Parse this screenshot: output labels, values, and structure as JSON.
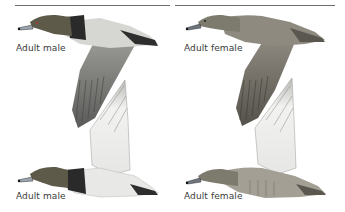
{
  "plates": [
    {
      "label": "Adult male",
      "pose": "flying-wing-down"
    },
    {
      "label": "Adult female",
      "pose": "flying-wing-down"
    },
    {
      "label": "Adult male",
      "pose": "flying-wing-up"
    },
    {
      "label": "Adult female",
      "pose": "flying-wing-up"
    }
  ],
  "colors": {
    "male_head": "#5e5a4a",
    "male_breast": "#2a2a2a",
    "male_body_grey": "#cfcfcc",
    "female_head": "#7d7a6e",
    "female_body": "#9a958a",
    "rule": "#6b6b6b"
  }
}
